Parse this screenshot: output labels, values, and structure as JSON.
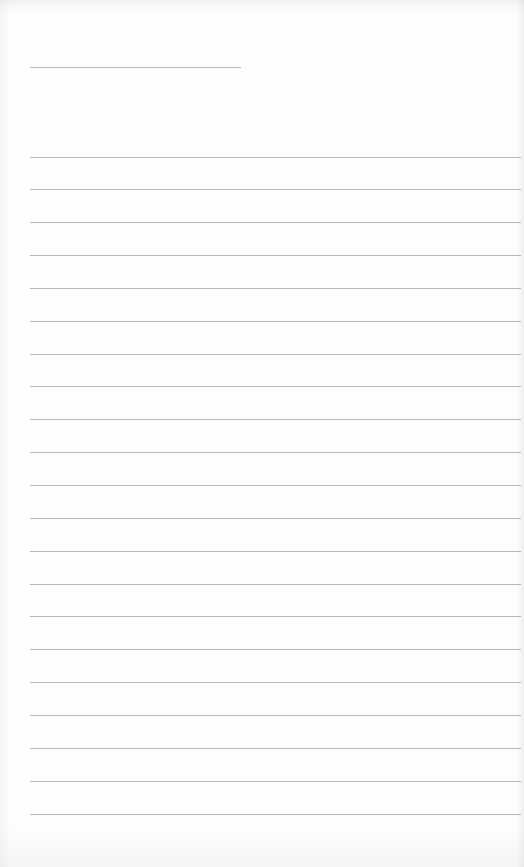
{
  "document": {
    "type": "lined-writing-page",
    "rule_color": "#b9b9b9",
    "background_color": "#fdfdfd",
    "header_line": {
      "top": 67,
      "left": 30,
      "width": 211
    },
    "body_lines": {
      "count": 21,
      "first_top": 156.5,
      "spacing": 32.85,
      "left": 30,
      "width": 491
    }
  }
}
